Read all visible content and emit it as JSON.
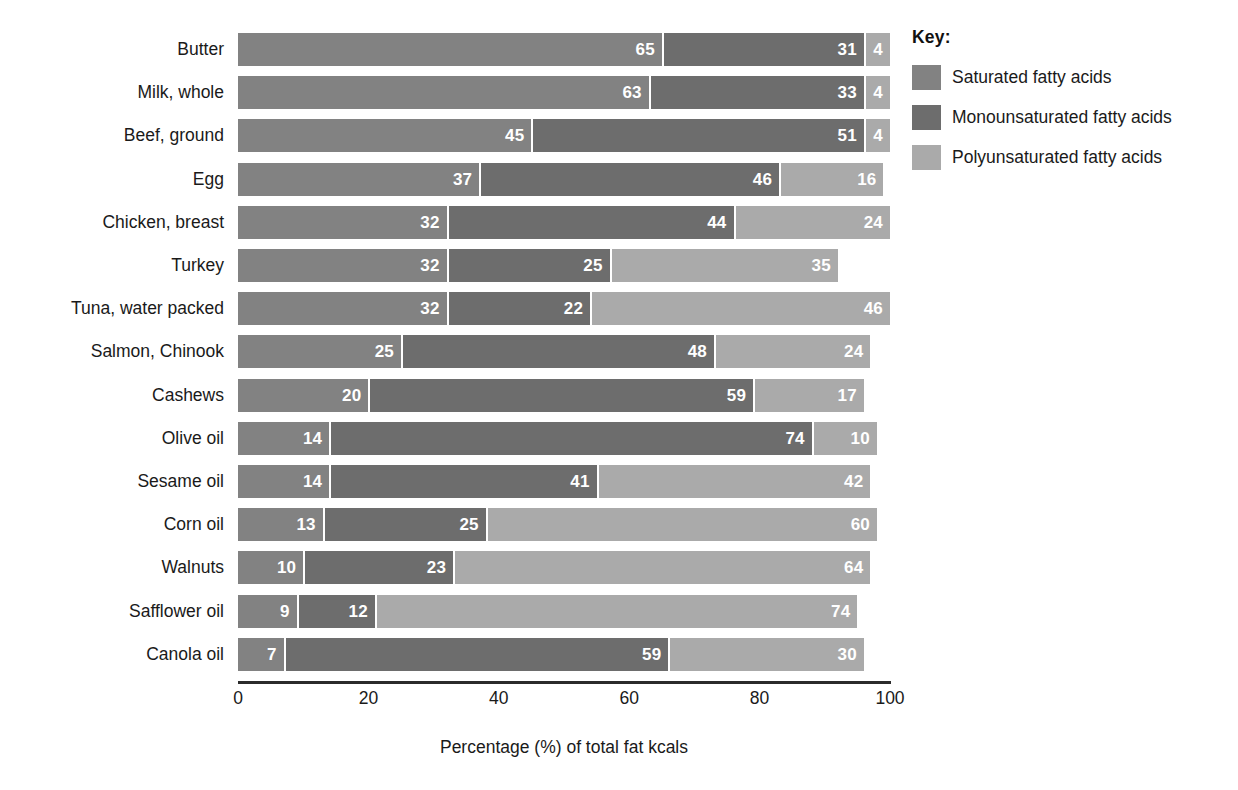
{
  "chart_data": {
    "type": "bar",
    "subtype": "horizontal-stacked-100",
    "title": "",
    "xlabel": "Percentage (%) of total fat kcals",
    "ylabel": "",
    "xlim": [
      0,
      100
    ],
    "xticks": [
      "0",
      "20",
      "40",
      "60",
      "80",
      "100"
    ],
    "grid": false,
    "legend_position": "right",
    "legend_title": "Key:",
    "categories": [
      "Butter",
      "Milk, whole",
      "Beef, ground",
      "Egg",
      "Chicken, breast",
      "Turkey",
      "Tuna, water packed",
      "Salmon, Chinook",
      "Cashews",
      "Olive oil",
      "Sesame oil",
      "Corn oil",
      "Walnuts",
      "Safflower oil",
      "Canola oil"
    ],
    "series": [
      {
        "name": "Saturated fatty acids",
        "color": "#828282",
        "values": [
          65,
          63,
          45,
          37,
          32,
          32,
          32,
          25,
          20,
          14,
          14,
          13,
          10,
          9,
          7
        ]
      },
      {
        "name": "Monounsaturated fatty acids",
        "color": "#6d6d6d",
        "values": [
          31,
          33,
          51,
          46,
          44,
          25,
          22,
          48,
          59,
          74,
          41,
          25,
          23,
          12,
          59
        ]
      },
      {
        "name": "Polyunsaturated fatty acids",
        "color": "#aaaaaa",
        "values": [
          4,
          4,
          4,
          16,
          24,
          35,
          46,
          24,
          17,
          10,
          42,
          60,
          64,
          74,
          30
        ]
      }
    ]
  }
}
